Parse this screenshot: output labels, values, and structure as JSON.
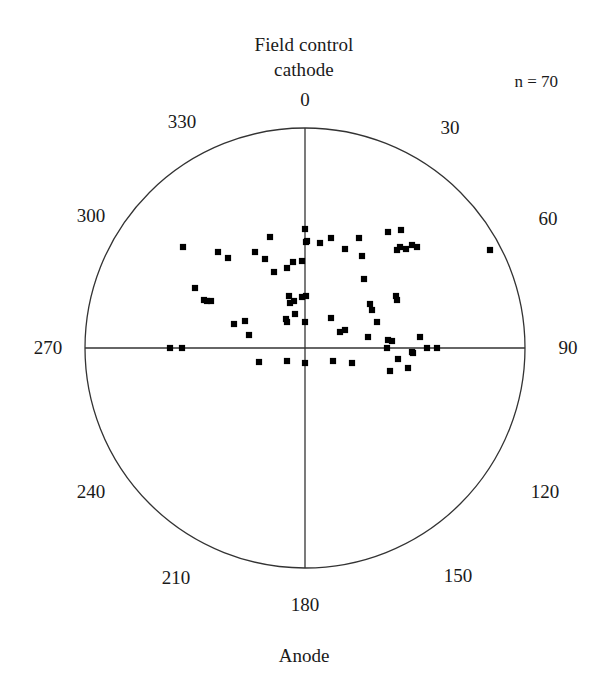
{
  "figure": {
    "title_line1": "Field control",
    "title_line2": "cathode",
    "sample_size_label": "n = 70",
    "bottom_caption": "Anode",
    "stroke_color": "#333333",
    "point_color": "#000000"
  },
  "chart_data": {
    "type": "scatter",
    "subtype": "polar-rose-diagram",
    "title": "Field control cathode",
    "annotations": [
      "n = 70",
      "Anode"
    ],
    "n": 70,
    "axis_ticks_deg": [
      0,
      30,
      60,
      90,
      120,
      150,
      180,
      210,
      240,
      270,
      300,
      330
    ],
    "tick_labels": [
      "0",
      "30",
      "60",
      "90",
      "120",
      "150",
      "180",
      "210",
      "240",
      "270",
      "300",
      "330"
    ],
    "labeled_ticks_drawn": [
      "0",
      "90",
      "180",
      "270"
    ],
    "grid": false,
    "legend": "none",
    "center_px": [
      305,
      348
    ],
    "radius_px": 220,
    "xlabel": "",
    "ylabel": "",
    "points_px": [
      [
        183,
        247
      ],
      [
        218,
        252
      ],
      [
        228,
        258
      ],
      [
        255,
        252
      ],
      [
        265,
        259
      ],
      [
        270,
        237
      ],
      [
        287,
        268
      ],
      [
        293,
        262
      ],
      [
        274,
        272
      ],
      [
        302,
        261
      ],
      [
        305,
        229
      ],
      [
        306,
        242
      ],
      [
        307,
        241
      ],
      [
        320,
        243
      ],
      [
        331,
        238
      ],
      [
        345,
        249
      ],
      [
        359,
        238
      ],
      [
        362,
        256
      ],
      [
        388,
        232
      ],
      [
        401,
        230
      ],
      [
        400,
        247
      ],
      [
        397,
        250
      ],
      [
        406,
        249
      ],
      [
        412,
        245
      ],
      [
        417,
        247
      ],
      [
        490,
        250
      ],
      [
        195,
        288
      ],
      [
        204,
        300
      ],
      [
        207,
        301
      ],
      [
        211,
        301
      ],
      [
        289,
        296
      ],
      [
        290,
        303
      ],
      [
        294,
        301
      ],
      [
        302,
        297
      ],
      [
        306,
        296
      ],
      [
        295,
        314
      ],
      [
        305,
        322
      ],
      [
        331,
        318
      ],
      [
        340,
        332
      ],
      [
        345,
        330
      ],
      [
        364,
        279
      ],
      [
        370,
        304
      ],
      [
        372,
        310
      ],
      [
        377,
        322
      ],
      [
        368,
        337
      ],
      [
        396,
        296
      ],
      [
        397,
        300
      ],
      [
        420,
        337
      ],
      [
        234,
        324
      ],
      [
        245,
        321
      ],
      [
        249,
        335
      ],
      [
        286,
        319
      ],
      [
        287,
        322
      ],
      [
        170,
        348
      ],
      [
        182,
        348
      ],
      [
        387,
        348
      ],
      [
        427,
        348
      ],
      [
        437,
        348
      ],
      [
        388,
        340
      ],
      [
        392,
        341
      ],
      [
        259,
        362
      ],
      [
        287,
        361
      ],
      [
        305,
        363
      ],
      [
        333,
        361
      ],
      [
        352,
        363
      ],
      [
        398,
        359
      ],
      [
        408,
        368
      ],
      [
        390,
        371
      ],
      [
        412,
        352
      ],
      [
        413,
        353
      ]
    ]
  },
  "tick_label_positions": [
    {
      "label": "0",
      "x": 305,
      "y": 100
    },
    {
      "label": "30",
      "x": 450,
      "y": 128
    },
    {
      "label": "60",
      "x": 548,
      "y": 219
    },
    {
      "label": "90",
      "x": 568,
      "y": 348
    },
    {
      "label": "120",
      "x": 545,
      "y": 492
    },
    {
      "label": "150",
      "x": 458,
      "y": 576
    },
    {
      "label": "180",
      "x": 305,
      "y": 605
    },
    {
      "label": "210",
      "x": 176,
      "y": 578
    },
    {
      "label": "240",
      "x": 91,
      "y": 492
    },
    {
      "label": "300",
      "x": 91,
      "y": 216
    },
    {
      "label": "270",
      "x": 48,
      "y": 348
    },
    {
      "label": "330",
      "x": 182,
      "y": 122
    }
  ]
}
